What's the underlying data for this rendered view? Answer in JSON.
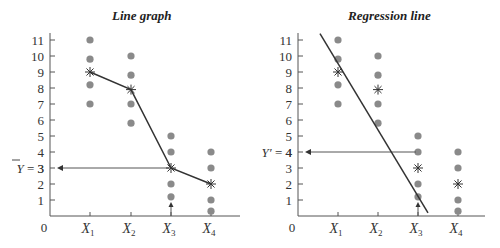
{
  "chart_data": [
    {
      "type": "scatter",
      "title": "Line graph",
      "xlabel": "",
      "ylabel": "",
      "origin_label": "0",
      "categories": [
        "X1",
        "X2",
        "X3",
        "X4"
      ],
      "yticks": [
        1,
        2,
        3,
        4,
        5,
        6,
        7,
        8,
        9,
        10,
        11
      ],
      "ylim": [
        0,
        11.5
      ],
      "grid": false,
      "points": {
        "X1": [
          11,
          9.8,
          8.2,
          7
        ],
        "X2": [
          10,
          8.8,
          7,
          5.8
        ],
        "X3": [
          5,
          4,
          2,
          1.2
        ],
        "X4": [
          4,
          3,
          1,
          0.3
        ]
      },
      "means": [
        9,
        7.9,
        3,
        2
      ],
      "line": {
        "type": "line",
        "through": "means",
        "values": [
          9,
          7.9,
          3,
          2
        ]
      },
      "annotation": {
        "label": "Y̅ = 3",
        "y": 3,
        "x_from": "X3",
        "arrow_up_at": "X3"
      },
      "marker_means": "asterisk",
      "marker_points": "filled-circle",
      "point_color": "#8a8a8a"
    },
    {
      "type": "scatter",
      "title": "Regression line",
      "xlabel": "",
      "ylabel": "",
      "origin_label": "0",
      "categories": [
        "X1",
        "X2",
        "X3",
        "X4"
      ],
      "yticks": [
        1,
        2,
        3,
        4,
        5,
        6,
        7,
        8,
        9,
        10,
        11
      ],
      "ylim": [
        0,
        11.5
      ],
      "grid": false,
      "points": {
        "X1": [
          11,
          9.8,
          8.2,
          7
        ],
        "X2": [
          10,
          8.8,
          7,
          5.8
        ],
        "X3": [
          5,
          4,
          2,
          1.2
        ],
        "X4": [
          4,
          3,
          1,
          0.3
        ]
      },
      "means": [
        9,
        7.9,
        3,
        2
      ],
      "regression_line": {
        "start": [
          0.55,
          11.4
        ],
        "end": [
          3.25,
          0.2
        ]
      },
      "annotation": {
        "label": "Y′ = 4",
        "y": 4,
        "x_from": "X3",
        "arrow_up_at": "X3"
      },
      "marker_means": "asterisk",
      "marker_points": "filled-circle",
      "point_color": "#8a8a8a"
    }
  ],
  "charts": {
    "left": {
      "title": "Line graph",
      "ann": "= 3",
      "ann_sym": "Y"
    },
    "right": {
      "title": "Regression line",
      "ann": "= 4",
      "ann_sym": "Y′"
    }
  }
}
